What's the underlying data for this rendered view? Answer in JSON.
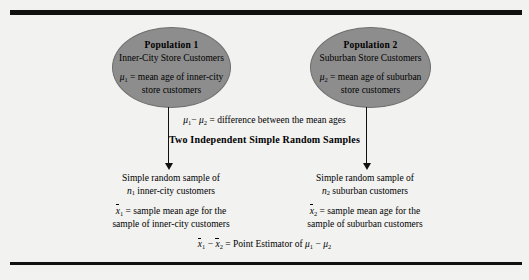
{
  "figure": {
    "background_color": "#f2f2f0",
    "rule_color": "#111111",
    "ellipse_fill": "#8d8d8d"
  },
  "population_1": {
    "title": "Population 1",
    "subtitle": "Inner-City Store Customers",
    "parameter_symbol": "μ",
    "parameter_subscript": "1",
    "parameter_text_line1": "= mean age of inner-city",
    "parameter_text_line2": "store customers"
  },
  "population_2": {
    "title": "Population 2",
    "subtitle": "Suburban Store Customers",
    "parameter_symbol": "μ",
    "parameter_subscript": "2",
    "parameter_text_line1": "= mean age of suburban",
    "parameter_text_line2": "store customers"
  },
  "middle": {
    "difference_prefix": "μ",
    "difference_sub1": "1",
    "difference_minus": "− ",
    "difference_sub2": "2",
    "difference_text": "= difference between the mean ages",
    "heading": "Two Independent Simple Random Samples"
  },
  "sample_left": {
    "line1": "Simple random sample of",
    "size_symbol": "n",
    "size_subscript": "1",
    "line2_rest": "inner-city customers",
    "stat_symbol": "x",
    "stat_subscript": "1",
    "stat_line1": "= sample mean age for the",
    "stat_line2": "sample of inner-city customers"
  },
  "sample_right": {
    "line1": "Simple random sample of",
    "size_symbol": "n",
    "size_subscript": "2",
    "line2_rest": "suburban customers",
    "stat_symbol": "x",
    "stat_subscript": "2",
    "stat_line1": "= sample mean age for the",
    "stat_line2": "sample of suburban customers"
  },
  "estimator": {
    "stat1_symbol": "x",
    "stat1_subscript": "1",
    "minus": "−",
    "stat2_symbol": "x",
    "stat2_subscript": "2",
    "label": "= Point Estimator of",
    "param1_symbol": "μ",
    "param1_subscript": "1",
    "param_minus": "−",
    "param2_symbol": "μ",
    "param2_subscript": "2"
  }
}
